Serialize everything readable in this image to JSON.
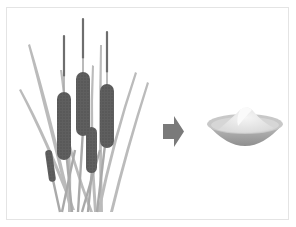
{
  "illustration": {
    "left_subject": "cattail-plants",
    "transition": "arrow-right",
    "right_subject": "bowl-of-powder",
    "colors": {
      "frame_border": "#e4e4e4",
      "leaf": "#b5b5b5",
      "leaf_dark": "#9a9a9a",
      "stem": "#a8a8a8",
      "spike_tip": "#6e6e6e",
      "cattail_head": "#5f5f5f",
      "arrow": "#7a7a7a",
      "bowl_outer": "#a9a9a9",
      "bowl_rim": "#c9c9c9",
      "powder": "#e6e6e6"
    }
  }
}
